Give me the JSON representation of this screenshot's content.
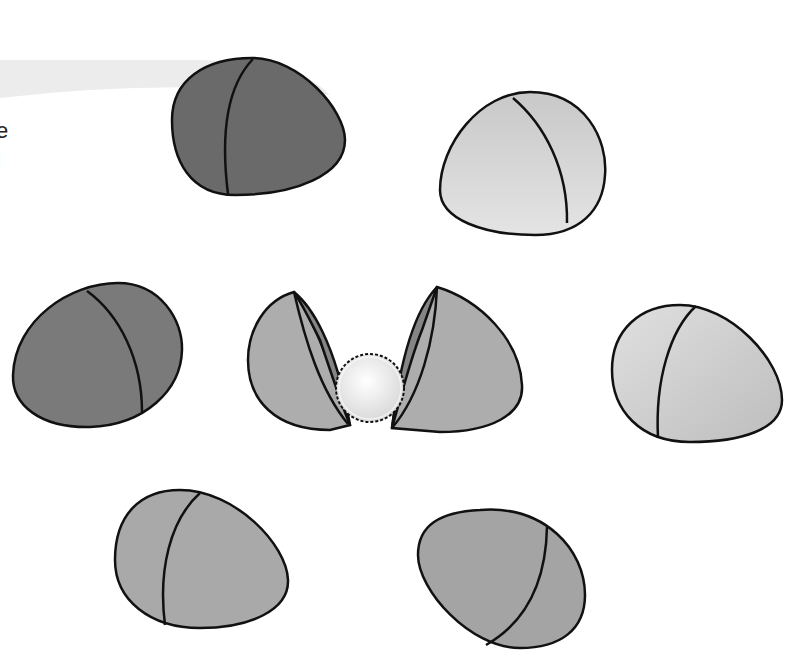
{
  "scene": {
    "description": "Illustration of seven eggs, one cracked open revealing a fluffy ball",
    "background": "#ffffff",
    "band_color": "#ececec",
    "outline_color": "#111111"
  },
  "edge_text": {
    "line1": "e",
    "line2": "l"
  },
  "eggs": [
    {
      "name": "dark-egg-top",
      "fill": "#6a6a6a"
    },
    {
      "name": "light-egg-top-right",
      "fill": "#d4d4d4"
    },
    {
      "name": "dark-egg-middle-left",
      "fill": "#7a7a7a"
    },
    {
      "name": "light-egg-middle-right",
      "fill": "#cdcdcd"
    },
    {
      "name": "medium-egg-bottom-left",
      "fill": "#a9a9a9"
    },
    {
      "name": "medium-egg-bottom-right",
      "fill": "#a4a4a4"
    }
  ],
  "cracked_egg": {
    "shell_outer": "#adadad",
    "shell_inner": "#858585",
    "ball_fill": "#ececec"
  }
}
